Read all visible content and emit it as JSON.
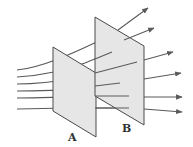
{
  "diagram": {
    "type": "field-lines-through-surfaces",
    "colors": {
      "plane_fill": "#e6e6e6",
      "plane_stroke": "#4a4a4a",
      "line": "#5a5a5a",
      "label": "#333333"
    },
    "planes": [
      {
        "id": "A",
        "label": "A",
        "points": [
          [
            53,
            47
          ],
          [
            96,
            73
          ],
          [
            96,
            137
          ],
          [
            53,
            111
          ]
        ],
        "label_pos": [
          72,
          137
        ]
      },
      {
        "id": "B",
        "label": "B",
        "points": [
          [
            95,
            17
          ],
          [
            144,
            46
          ],
          [
            144,
            125
          ],
          [
            95,
            96
          ]
        ],
        "label_pos": [
          126,
          130
        ]
      }
    ],
    "field_lines": [
      {
        "start": [
          17,
          70
        ],
        "end": [
          148,
          8
        ]
      },
      {
        "start": [
          17,
          77
        ],
        "end": [
          154,
          28
        ]
      },
      {
        "start": [
          17,
          84
        ],
        "end": [
          173,
          52
        ]
      },
      {
        "start": [
          17,
          91
        ],
        "end": [
          181,
          73
        ]
      },
      {
        "start": [
          17,
          97
        ],
        "end": [
          182,
          97
        ]
      },
      {
        "start": [
          17,
          108
        ],
        "end": [
          182,
          112
        ]
      }
    ]
  }
}
